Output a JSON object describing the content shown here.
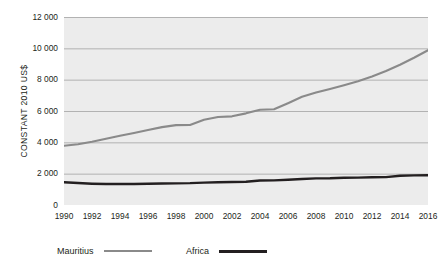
{
  "chart_data": {
    "type": "line",
    "title": "",
    "xlabel": "",
    "ylabel": "CONSTANT 2010 US$",
    "ylim": [
      0,
      12000
    ],
    "xlim": [
      1990,
      2016
    ],
    "grid": true,
    "legend_position": "bottom-left",
    "yticks": [
      0,
      2000,
      4000,
      6000,
      8000,
      10000,
      12000
    ],
    "ytick_labels": [
      "0",
      "2 000",
      "4 000",
      "6 000",
      "8 000",
      "10 000",
      "12 000"
    ],
    "xticks": [
      1990,
      1992,
      1994,
      1996,
      1998,
      2000,
      2002,
      2004,
      2006,
      2008,
      2010,
      2012,
      2014,
      2016
    ],
    "xtick_labels": [
      "1990",
      "1992",
      "1994",
      "1996",
      "1998",
      "2000",
      "2002",
      "2004",
      "2006",
      "2008",
      "2010",
      "2012",
      "2014",
      "2016"
    ],
    "x": [
      1990,
      1991,
      1992,
      1993,
      1994,
      1995,
      1996,
      1997,
      1998,
      1999,
      2000,
      2001,
      2002,
      2003,
      2004,
      2005,
      2006,
      2007,
      2008,
      2009,
      2010,
      2011,
      2012,
      2013,
      2014,
      2015,
      2016
    ],
    "series": [
      {
        "name": "Mauritius",
        "color": "#8a8a8a",
        "width": 2.1,
        "values": [
          3780,
          3880,
          4040,
          4230,
          4420,
          4600,
          4790,
          4970,
          5100,
          5110,
          5440,
          5620,
          5660,
          5850,
          6080,
          6110,
          6500,
          6910,
          7180,
          7400,
          7640,
          7900,
          8200,
          8550,
          8950,
          9400,
          9880
        ]
      },
      {
        "name": "Africa",
        "color": "#231f20",
        "width": 2.4,
        "values": [
          1450,
          1400,
          1360,
          1340,
          1340,
          1345,
          1355,
          1370,
          1380,
          1395,
          1430,
          1455,
          1470,
          1485,
          1560,
          1570,
          1610,
          1660,
          1700,
          1710,
          1740,
          1750,
          1770,
          1780,
          1870,
          1890,
          1895
        ]
      }
    ],
    "colors": {
      "plot_background": "#ececec",
      "gridline": "#9a9a9a",
      "mauritius": "#8a8a8a",
      "africa": "#231f20",
      "text": "#231f20",
      "page_background": "#ffffff"
    }
  },
  "legend": {
    "items": [
      {
        "label": "Mauritius",
        "color": "#8a8a8a",
        "thickness": "2px",
        "left": "57px"
      },
      {
        "label": "Africa",
        "color": "#231f20",
        "thickness": "3px",
        "left": "186px"
      }
    ]
  }
}
